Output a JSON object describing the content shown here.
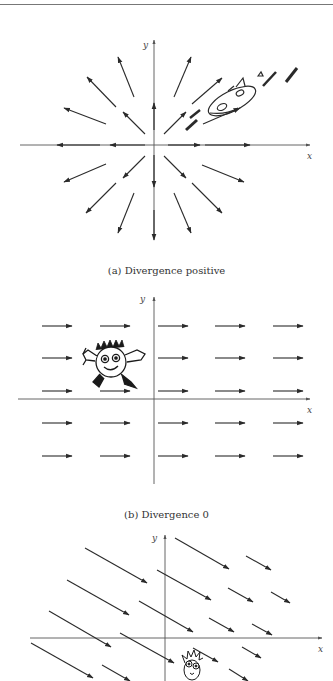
{
  "colors": {
    "ink": "#2a2a2a",
    "axis": "#555555",
    "background": "#ffffff"
  },
  "panels": [
    {
      "id": "a",
      "caption": "(a) Divergence positive",
      "axis_labels": {
        "x": "x",
        "y": "y"
      },
      "origin": [
        154,
        145
      ],
      "x_axis": [
        20,
        310
      ],
      "y_axis": [
        40,
        235
      ],
      "arrows": [
        [
          145,
          145,
          110,
          145
        ],
        [
          100,
          145,
          57,
          145
        ],
        [
          168,
          145,
          200,
          145
        ],
        [
          205,
          145,
          250,
          145
        ],
        [
          154,
          130,
          154,
          103
        ],
        [
          154,
          155,
          154,
          187
        ],
        [
          145,
          134,
          123,
          112
        ],
        [
          116,
          107,
          87,
          77
        ],
        [
          106,
          124,
          64,
          108
        ],
        [
          134,
          97,
          118,
          57
        ],
        [
          164,
          134,
          186,
          112
        ],
        [
          174,
          97,
          191,
          57
        ],
        [
          192,
          104,
          222,
          78
        ],
        [
          145,
          156,
          123,
          178
        ],
        [
          116,
          183,
          86,
          213
        ],
        [
          106,
          164,
          64,
          182
        ],
        [
          134,
          193,
          118,
          233
        ],
        [
          164,
          156,
          186,
          178
        ],
        [
          192,
          183,
          222,
          213
        ],
        [
          202,
          165,
          244,
          182
        ],
        [
          174,
          193,
          191,
          233
        ],
        [
          154,
          210,
          154,
          240
        ]
      ],
      "character": "cartoon-bug-riding-outward",
      "character_box": [
        185,
        70,
        300,
        130
      ]
    },
    {
      "id": "b",
      "caption": "(b) Divergence 0",
      "axis_labels": {
        "x": "x",
        "y": "y"
      },
      "origin": [
        154,
        399
      ],
      "x_axis": [
        18,
        310
      ],
      "y_axis": [
        297,
        484
      ],
      "rows_y": [
        326,
        358,
        391,
        423,
        456
      ],
      "cols_x": [
        [
          42,
          72
        ],
        [
          100,
          130
        ],
        [
          158,
          188
        ],
        [
          215,
          245
        ],
        [
          273,
          303
        ]
      ],
      "character": "smiling-fuzzy-ball",
      "character_center": [
        111,
        361
      ]
    },
    {
      "id": "c",
      "caption": "",
      "axis_labels": {
        "x": "x",
        "y": "y"
      },
      "origin": [
        165,
        638
      ],
      "x_axis": [
        30,
        322
      ],
      "y_axis": [
        535,
        681
      ],
      "arrows": [
        [
          85,
          548,
          147,
          583
        ],
        [
          175,
          538,
          229,
          569
        ],
        [
          246,
          556,
          271,
          570
        ],
        [
          67,
          580,
          129,
          615
        ],
        [
          157,
          570,
          211,
          600
        ],
        [
          228,
          588,
          253,
          602
        ],
        [
          271,
          592,
          290,
          603
        ],
        [
          49,
          611,
          111,
          647
        ],
        [
          139,
          601,
          193,
          632
        ],
        [
          209,
          618,
          234,
          632
        ],
        [
          252,
          624,
          272,
          635
        ],
        [
          31,
          643,
          93,
          678
        ],
        [
          120,
          633,
          174,
          663
        ],
        [
          193,
          648,
          218,
          662
        ],
        [
          242,
          647,
          261,
          658
        ],
        [
          102,
          665,
          130,
          681
        ],
        [
          229,
          669,
          248,
          681
        ]
      ],
      "character": "frazzled-face",
      "character_center": [
        193,
        666
      ]
    }
  ]
}
